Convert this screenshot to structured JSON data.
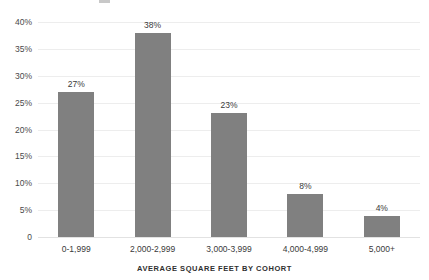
{
  "chart_data": {
    "type": "bar",
    "title": "",
    "subtitle": "",
    "xlabel": "AVERAGE SQUARE FEET BY COHORT",
    "ylabel": "",
    "categories": [
      "0-1,999",
      "2,000-2,999",
      "3,000-3,999",
      "4,000-4,999",
      "5,000+"
    ],
    "values": [
      27,
      38,
      23,
      8,
      4
    ],
    "value_labels": [
      "27%",
      "38%",
      "23%",
      "8%",
      "4%"
    ],
    "ylim": [
      0,
      40
    ],
    "ytick_values": [
      0,
      5,
      10,
      15,
      20,
      25,
      30,
      35,
      40
    ],
    "ytick_labels": [
      "0",
      "5%",
      "10%",
      "15%",
      "20%",
      "25%",
      "30%",
      "35%",
      "40%"
    ],
    "grid": true,
    "grid_axis": "y",
    "legend": false,
    "legend_position": "none",
    "bar_color": "#808080",
    "gridline_color": "#ededed",
    "text_color": "#3a3a3a",
    "background_color": "#ffffff"
  }
}
